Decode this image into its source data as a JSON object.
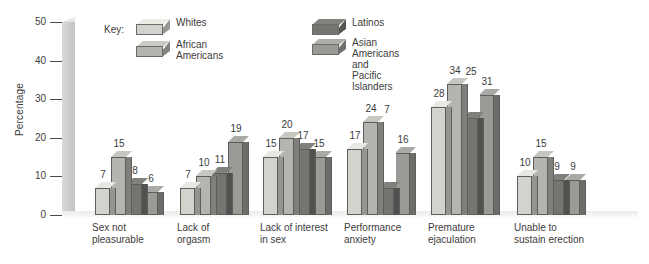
{
  "chart_data": {
    "type": "bar",
    "title": "",
    "xlabel": "",
    "ylabel": "Percentage",
    "ylim": [
      0,
      50
    ],
    "yticks": [
      0,
      10,
      20,
      30,
      40,
      50
    ],
    "grid": false,
    "legend_position": "top",
    "legend_title": "Key:",
    "categories": [
      "Sex not\npleasurable",
      "Lack of\norgasm",
      "Lack of interest\nin sex",
      "Performance\nanxiety",
      "Premature\nejaculation",
      "Unable to\nsustain erection"
    ],
    "series": [
      {
        "name": "Whites",
        "color": "#d3d3ce",
        "values": [
          7,
          7,
          15,
          17,
          28,
          10
        ]
      },
      {
        "name": "African Americans",
        "color": "#b5b5b0",
        "values": [
          15,
          10,
          20,
          24,
          34,
          15
        ]
      },
      {
        "name": "Latinos",
        "color": "#747471",
        "values": [
          8,
          11,
          17,
          7,
          25,
          9
        ]
      },
      {
        "name": "Asian Americans\nand Pacific Islanders",
        "color": "#9a9a96",
        "values": [
          6,
          19,
          15,
          16,
          31,
          9
        ]
      }
    ]
  },
  "axis": {
    "y_title": "Percentage",
    "ticks": [
      "50",
      "40",
      "30",
      "20",
      "10",
      "0"
    ]
  },
  "legend": {
    "title": "Key:",
    "entries": [
      {
        "label": "Whites"
      },
      {
        "label": "African Americans"
      },
      {
        "label": "Latinos"
      },
      {
        "label": "Asian Americans\nand Pacific Islanders"
      }
    ]
  },
  "categories": [
    {
      "label": "Sex not\npleasurable"
    },
    {
      "label": "Lack of\norgasm"
    },
    {
      "label": "Lack of interest\nin sex"
    },
    {
      "label": "Performance\nanxiety"
    },
    {
      "label": "Premature\nejaculation"
    },
    {
      "label": "Unable to\nsustain erection"
    }
  ],
  "values": {
    "g0": [
      "7",
      "15",
      "8",
      "6"
    ],
    "g1": [
      "7",
      "10",
      "11",
      "19"
    ],
    "g2": [
      "15",
      "20",
      "17",
      "15"
    ],
    "g3": [
      "17",
      "24",
      "7",
      "16"
    ],
    "g4": [
      "28",
      "34",
      "25",
      "31"
    ],
    "g5": [
      "10",
      "15",
      "9",
      "9"
    ]
  }
}
